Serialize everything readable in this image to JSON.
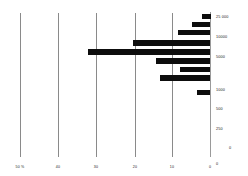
{
  "chart_data": {
    "type": "bar",
    "orientation": "horizontal",
    "title": "",
    "subtitle": "",
    "xlabel": "",
    "ylabel": "",
    "grid": true,
    "legend": null,
    "bar_color": "#0d0d0d",
    "grid_color": "#8a8a8a",
    "axis_color": "#9a9a9a",
    "direction": "right-to-left",
    "xlim": [
      0,
      50
    ],
    "x_ticks": [
      {
        "value": 50,
        "label": "50 %",
        "x_px": 20
      },
      {
        "value": 40,
        "label": "40",
        "x_px": 58
      },
      {
        "value": 30,
        "label": "30",
        "x_px": 96
      },
      {
        "value": 20,
        "label": "20",
        "x_px": 135
      },
      {
        "value": 10,
        "label": "10",
        "x_px": 172
      },
      {
        "value": 0,
        "label": "0",
        "x_px": 210
      }
    ],
    "y_ticks": [
      {
        "label": "25 000",
        "y_px": 16
      },
      {
        "label": "10000",
        "y_px": 36
      },
      {
        "label": "5000",
        "y_px": 56
      },
      {
        "label": "1000",
        "y_px": 89
      },
      {
        "label": "500",
        "y_px": 108
      },
      {
        "label": "250",
        "y_px": 128
      },
      {
        "label": "0",
        "y_px": 163
      }
    ],
    "categories": [
      "25 000",
      "",
      "10000",
      "",
      "5000",
      "",
      "",
      "1000",
      ""
    ],
    "values": [
      2.3,
      4.6,
      8.2,
      20.0,
      32.0,
      14.2,
      7.8,
      13.0,
      3.2
    ],
    "bars": [
      {
        "index": 0,
        "value": 2.3,
        "y_px": 14,
        "height_px": 4.5,
        "left_px": 201.5,
        "width_px": 9
      },
      {
        "index": 1,
        "value": 4.6,
        "y_px": 21.5,
        "height_px": 5,
        "left_px": 192,
        "width_px": 18
      },
      {
        "index": 2,
        "value": 8.2,
        "y_px": 29.5,
        "height_px": 5,
        "left_px": 178,
        "width_px": 32
      },
      {
        "index": 3,
        "value": 20.0,
        "y_px": 40,
        "height_px": 6,
        "left_px": 133,
        "width_px": 77
      },
      {
        "index": 4,
        "value": 32.0,
        "y_px": 49,
        "height_px": 6,
        "left_px": 88,
        "width_px": 122
      },
      {
        "index": 5,
        "value": 14.2,
        "y_px": 58,
        "height_px": 5.5,
        "left_px": 156,
        "width_px": 54
      },
      {
        "index": 6,
        "value": 7.8,
        "y_px": 66.5,
        "height_px": 5,
        "left_px": 180,
        "width_px": 30
      },
      {
        "index": 7,
        "value": 13.0,
        "y_px": 75,
        "height_px": 5.5,
        "left_px": 160,
        "width_px": 50
      },
      {
        "index": 8,
        "value": 3.2,
        "y_px": 90,
        "height_px": 5,
        "left_px": 197,
        "width_px": 13
      }
    ],
    "axis_geometry": {
      "baseline_x_px": 210,
      "baseline_top_px": 12,
      "baseline_bottom_px": 157,
      "gridline_top_px": 13,
      "gridline_bottom_px": 157
    },
    "extra_labels": [
      {
        "name": "origin-zero-right",
        "label": "0",
        "x_px": 229,
        "y_px": 147
      }
    ]
  }
}
